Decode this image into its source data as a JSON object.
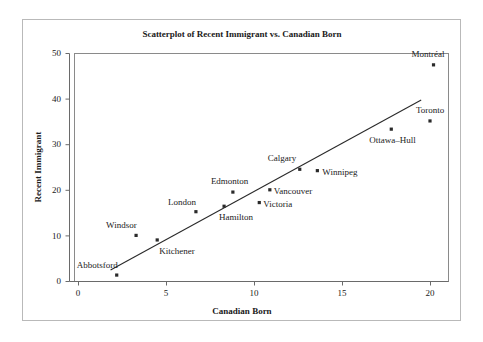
{
  "figure": {
    "title": "Scatterplot of Recent Immigrant vs. Canadian Born",
    "frame_color": "#b9b9b9",
    "background": "#ffffff"
  },
  "axes": {
    "x_label": "Canadian Born",
    "y_label": "Recent Immigrant",
    "x_ticks": [
      "0",
      "5",
      "10",
      "15",
      "20"
    ],
    "y_ticks": [
      "0",
      "10",
      "20",
      "30",
      "40",
      "50"
    ]
  },
  "chart_data": {
    "type": "scatter",
    "title": "Scatterplot of Recent Immigrant vs. Canadian Born",
    "xlabel": "Canadian Born",
    "ylabel": "Recent Immigrant",
    "xlim": [
      0,
      21.5
    ],
    "ylim": [
      0,
      51
    ],
    "xticks": [
      0,
      5,
      10,
      15,
      20
    ],
    "yticks": [
      0,
      10,
      20,
      30,
      40,
      50
    ],
    "grid": false,
    "legend": null,
    "point_color": "#2a2a2a",
    "line_color": "#2a2a2a",
    "points": [
      {
        "label": "Abbotsford",
        "x": 2.2,
        "y": 1.3,
        "label_dx": -40,
        "label_dy": -7
      },
      {
        "label": "Windsor",
        "x": 3.3,
        "y": 10.0,
        "label_dx": -30,
        "label_dy": -7
      },
      {
        "label": "Kitchener",
        "x": 4.5,
        "y": 9.0,
        "label_dx": 2,
        "label_dy": 14
      },
      {
        "label": "London",
        "x": 6.7,
        "y": 15.2,
        "label_dx": -28,
        "label_dy": -7
      },
      {
        "label": "Hamilton",
        "x": 8.3,
        "y": 16.4,
        "label_dx": -5,
        "label_dy": 14
      },
      {
        "label": "Edmonton",
        "x": 8.8,
        "y": 19.5,
        "label_dx": -22,
        "label_dy": -8
      },
      {
        "label": "Victoria",
        "x": 10.3,
        "y": 17.2,
        "label_dx": 4,
        "label_dy": 4
      },
      {
        "label": "Vancouver",
        "x": 10.9,
        "y": 20.0,
        "label_dx": 4,
        "label_dy": 4
      },
      {
        "label": "Calgary",
        "x": 12.6,
        "y": 24.5,
        "label_dx": -32,
        "label_dy": -8
      },
      {
        "label": "Winnipeg",
        "x": 13.6,
        "y": 24.2,
        "label_dx": 5,
        "label_dy": 4
      },
      {
        "label": "Ottawa--Hull",
        "x": 17.8,
        "y": 33.3,
        "label_dx": -22,
        "label_dy": 14
      },
      {
        "label": "Toronto",
        "x": 20.0,
        "y": 35.1,
        "label_dx": -14,
        "label_dy": -8
      },
      {
        "label": "Montréal",
        "x": 20.2,
        "y": 47.4,
        "label_dx": -22,
        "label_dy": -8
      }
    ],
    "fit_line": {
      "name": "least-squares regression line",
      "x_start": 1.85,
      "y_start": 2.4,
      "x_end": 19.5,
      "y_end": 39.7
    }
  }
}
